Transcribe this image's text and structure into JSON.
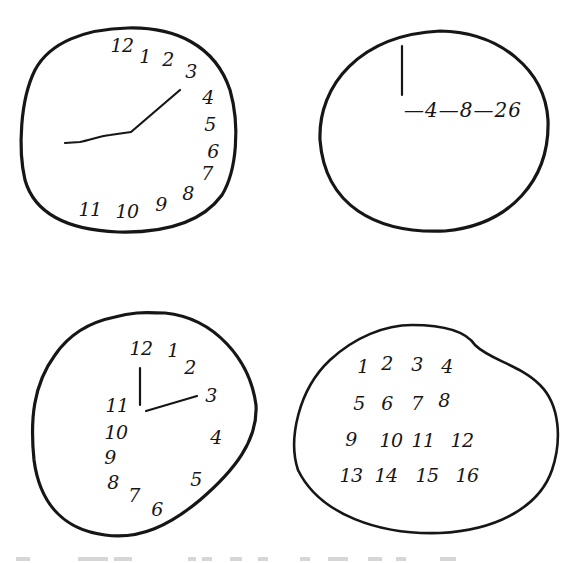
{
  "figure": {
    "colors": {
      "ink": "#161616",
      "background": "#ffffff"
    },
    "panels": [
      {
        "id": "clock-a",
        "description": "clock with all numbers crowded on the right side, single bent hand",
        "numbers": [
          {
            "label": "12",
            "x": 122,
            "y": 45
          },
          {
            "label": "1",
            "x": 145,
            "y": 56
          },
          {
            "label": "2",
            "x": 168,
            "y": 59
          },
          {
            "label": "3",
            "x": 191,
            "y": 71
          },
          {
            "label": "4",
            "x": 208,
            "y": 97
          },
          {
            "label": "5",
            "x": 210,
            "y": 124
          },
          {
            "label": "6",
            "x": 213,
            "y": 151
          },
          {
            "label": "7",
            "x": 207,
            "y": 173
          },
          {
            "label": "8",
            "x": 188,
            "y": 193
          },
          {
            "label": "9",
            "x": 161,
            "y": 204
          },
          {
            "label": "10",
            "x": 127,
            "y": 211
          },
          {
            "label": "11",
            "x": 90,
            "y": 209
          }
        ]
      },
      {
        "id": "clock-b",
        "description": "clock with a vertical hand and a sequence of numbers",
        "sequence_text": "—4—8—26"
      },
      {
        "id": "clock-c",
        "description": "clock with numbers bunched on the left, hands pointing to 12 and 3",
        "numbers": [
          {
            "label": "12",
            "x": 141,
            "y": 348
          },
          {
            "label": "1",
            "x": 173,
            "y": 350
          },
          {
            "label": "2",
            "x": 190,
            "y": 367
          },
          {
            "label": "3",
            "x": 211,
            "y": 395
          },
          {
            "label": "4",
            "x": 216,
            "y": 437
          },
          {
            "label": "5",
            "x": 196,
            "y": 479
          },
          {
            "label": "6",
            "x": 157,
            "y": 509
          },
          {
            "label": "7",
            "x": 134,
            "y": 495
          },
          {
            "label": "8",
            "x": 113,
            "y": 482
          },
          {
            "label": "9",
            "x": 110,
            "y": 457
          },
          {
            "label": "10",
            "x": 116,
            "y": 432
          },
          {
            "label": "11",
            "x": 117,
            "y": 405
          }
        ]
      },
      {
        "id": "clock-d",
        "description": "irregular blob with numbers 1–16 written in a grid",
        "numbers": [
          {
            "label": "1",
            "x": 363,
            "y": 366
          },
          {
            "label": "2",
            "x": 387,
            "y": 363
          },
          {
            "label": "3",
            "x": 417,
            "y": 364
          },
          {
            "label": "4",
            "x": 447,
            "y": 366
          },
          {
            "label": "5",
            "x": 359,
            "y": 403
          },
          {
            "label": "6",
            "x": 387,
            "y": 403
          },
          {
            "label": "7",
            "x": 417,
            "y": 403
          },
          {
            "label": "8",
            "x": 444,
            "y": 400
          },
          {
            "label": "9",
            "x": 351,
            "y": 439
          },
          {
            "label": "10",
            "x": 391,
            "y": 440
          },
          {
            "label": "11",
            "x": 423,
            "y": 440
          },
          {
            "label": "12",
            "x": 462,
            "y": 440
          },
          {
            "label": "13",
            "x": 351,
            "y": 475
          },
          {
            "label": "14",
            "x": 386,
            "y": 475
          },
          {
            "label": "15",
            "x": 427,
            "y": 475
          },
          {
            "label": "16",
            "x": 467,
            "y": 475
          }
        ]
      }
    ]
  }
}
